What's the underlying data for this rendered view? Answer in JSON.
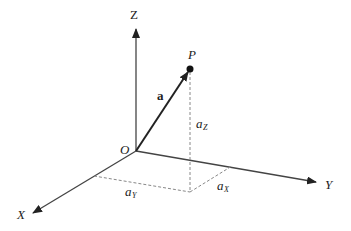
{
  "diagram": {
    "axes": {
      "x_label": "X",
      "y_label": "Y",
      "z_label": "Z"
    },
    "origin_label": "O",
    "point_label": "P",
    "vector_label": "a",
    "components": {
      "ax": {
        "base": "a",
        "sub": "X"
      },
      "ay": {
        "base": "a",
        "sub": "Y"
      },
      "az": {
        "base": "a",
        "sub": "Z"
      }
    },
    "colors": {
      "line": "#222222",
      "dashed": "#888888"
    }
  }
}
